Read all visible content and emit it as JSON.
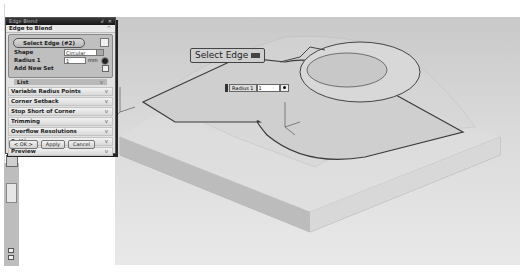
{
  "dialog": {
    "title": "Edge Blend",
    "title_controls": "↲ ✕",
    "section_main": "Edge to Blend",
    "section_main_chevron": "^",
    "select_edge_label": "Select Edge (#2)",
    "shape_label": "Shape",
    "shape_value": "Circular",
    "shape_icon": "circular-shape-icon",
    "radius_label": "Radius 1",
    "radius_value": "1",
    "radius_unit": "mm",
    "add_new_set_label": "Add New Set",
    "list_label": "List",
    "collapsed_sections": [
      {
        "label": "Variable Radius Points"
      },
      {
        "label": "Corner Setback"
      },
      {
        "label": "Stop Short of Corner"
      },
      {
        "label": "Trimming"
      },
      {
        "label": "Overflow Resolutions"
      },
      {
        "label": "Settings"
      },
      {
        "label": "Preview"
      }
    ],
    "chevron_down": "v",
    "buttons": {
      "ok": "< OK >",
      "apply": "Apply",
      "cancel": "Cancel"
    }
  },
  "viewport": {
    "select_edge_tooltip": "Select Edge",
    "radius_float_label": "Radius 1",
    "radius_float_value": "1"
  },
  "colors": {
    "titlebar": "#1e1e1e",
    "dialog_bg": "#e2e2e2",
    "viewport_bg": "#d4d4d4",
    "model_edge": "#3a3a3a"
  }
}
